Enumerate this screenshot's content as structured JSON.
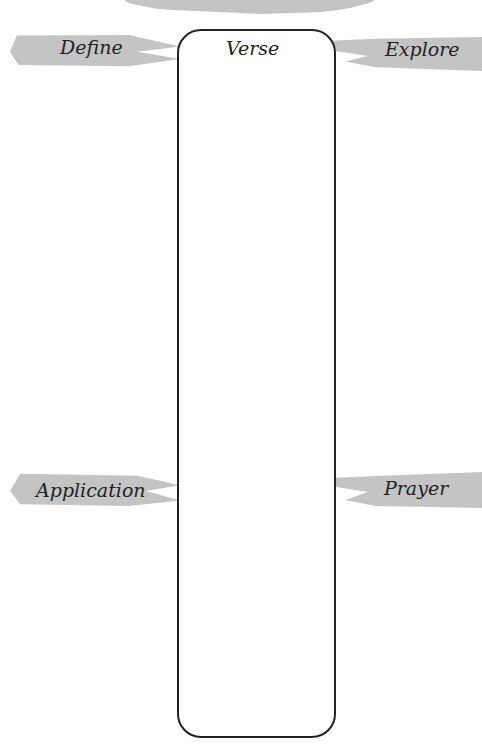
{
  "worksheet": {
    "center_box_title": "Verse",
    "labels": {
      "define": "Define",
      "explore": "Explore",
      "application": "Application",
      "prayer": "Prayer"
    }
  },
  "colors": {
    "brush": "#c4c4c4",
    "ink": "#222222"
  }
}
